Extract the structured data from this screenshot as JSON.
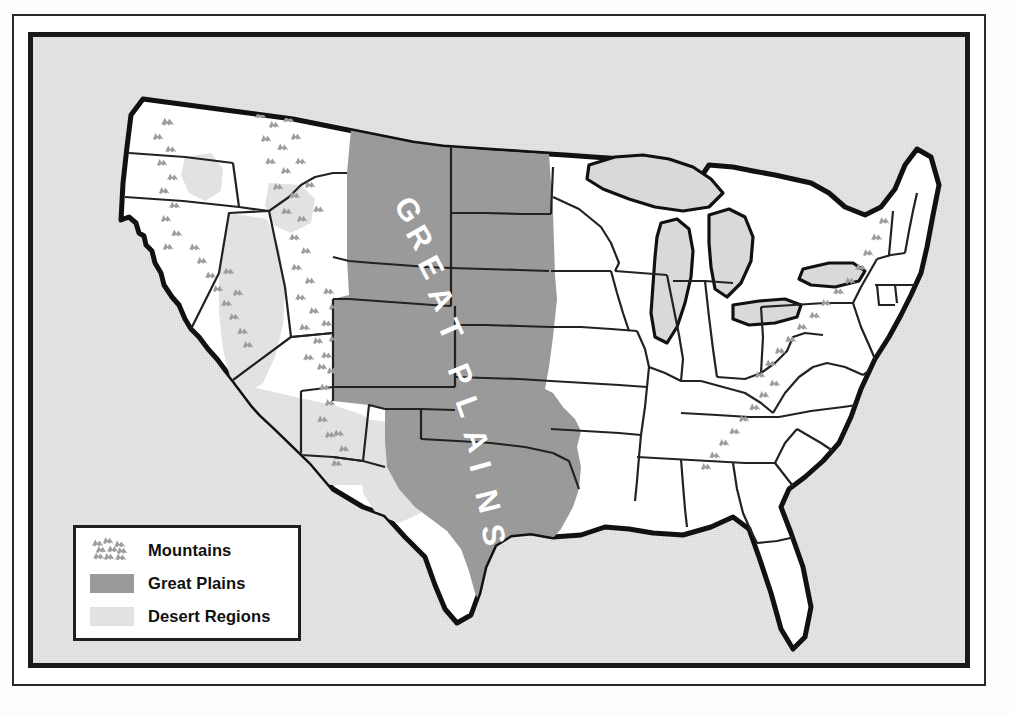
{
  "map": {
    "title_label": "GREAT PLAINS",
    "title_letters": [
      "G",
      "R",
      "E",
      "A",
      "T",
      "P",
      "L",
      "A",
      "I",
      "N",
      "S"
    ],
    "region_name": "United States physical regions map",
    "colors": {
      "great_plains": "#9a9a9a",
      "desert": "#e2e2e2",
      "mountains": "#9d9d9d",
      "lakes": "#d9d9d9",
      "land": "#ffffff",
      "background": "#e9e9e9",
      "outline": "#111111",
      "state_border": "#222222",
      "frame": "#1a1a1a"
    }
  },
  "legend": {
    "items": [
      {
        "label": "Mountains",
        "swatch": "mountain-symbol-swatch"
      },
      {
        "label": "Great Plains",
        "swatch": "solid-gray-swatch"
      },
      {
        "label": "Desert Regions",
        "swatch": "light-gray-swatch"
      }
    ]
  }
}
